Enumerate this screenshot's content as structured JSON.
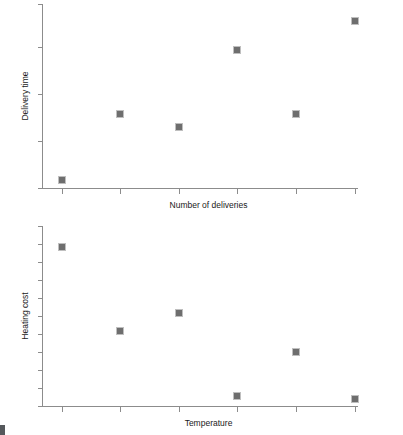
{
  "figure": {
    "background_color": "#ffffff",
    "marker_color": "#6e6e6e",
    "axis_color": "#8c8c8c",
    "text_color": "#1a1a1a",
    "panel_count": 2
  },
  "panels": {
    "top": {
      "name": "delivery-time-scatter",
      "xlabel": "Number of deliveries",
      "ylabel": "Delivery time"
    },
    "bottom": {
      "name": "heating-cost-scatter",
      "xlabel": "Temperature",
      "ylabel": "Heating cost"
    }
  },
  "chart_data": [
    {
      "type": "scatter",
      "title": "",
      "xlabel": "Number of deliveries",
      "ylabel": "Delivery time",
      "grid": false,
      "legend": null,
      "xlim": [
        0,
        6
      ],
      "ylim": [
        0,
        10
      ],
      "x_ticks": [
        1,
        2,
        3,
        4,
        5,
        6
      ],
      "x_tick_labels": [
        "",
        "",
        "",
        "",
        "",
        ""
      ],
      "y_ticks": [
        1,
        3,
        5,
        7,
        9
      ],
      "y_tick_labels": [
        "",
        "",
        "",
        "",
        ""
      ],
      "x": [
        1,
        2,
        3,
        4,
        5,
        6
      ],
      "y": [
        0.4,
        4.1,
        3.4,
        7.9,
        4.1,
        9.5
      ],
      "marker": "square",
      "marker_color": "#6e6e6e",
      "point_pixels": [
        {
          "x": 62,
          "y": 180
        },
        {
          "x": 120,
          "y": 114
        },
        {
          "x": 179,
          "y": 127
        },
        {
          "x": 237,
          "y": 50
        },
        {
          "x": 296,
          "y": 114
        },
        {
          "x": 355,
          "y": 21
        }
      ],
      "axis_pixels": {
        "x_axis_y": 188,
        "y_axis_x": 42,
        "x_axis_x0": 42,
        "x_axis_x1": 357,
        "y_axis_y0": 4,
        "y_axis_y1": 188,
        "x_tick_px": [
          62,
          120,
          179,
          237,
          296,
          355
        ],
        "y_tick_px": [
          4,
          47,
          94,
          141,
          188
        ]
      }
    },
    {
      "type": "scatter",
      "title": "",
      "xlabel": "Temperature",
      "ylabel": "Heating cost",
      "grid": false,
      "legend": null,
      "xlim": [
        0,
        6
      ],
      "ylim": [
        0,
        11
      ],
      "x_ticks": [
        1,
        2,
        3,
        4,
        5,
        6
      ],
      "x_tick_labels": [
        "",
        "",
        "",
        "",
        "",
        ""
      ],
      "y_ticks": [
        1,
        2,
        3,
        4,
        5,
        6,
        7,
        8,
        9,
        10,
        11
      ],
      "y_tick_labels": [
        "",
        "",
        "",
        "",
        "",
        "",
        "",
        "",
        "",
        "",
        ""
      ],
      "x": [
        1,
        2,
        3,
        4,
        5,
        6
      ],
      "y": [
        9.6,
        4.4,
        5.6,
        0.4,
        3.2,
        0.2
      ],
      "marker": "square",
      "marker_color": "#6e6e6e",
      "point_pixels": [
        {
          "x": 62,
          "y": 247
        },
        {
          "x": 120,
          "y": 331
        },
        {
          "x": 179,
          "y": 313
        },
        {
          "x": 237,
          "y": 396
        },
        {
          "x": 296,
          "y": 352
        },
        {
          "x": 355,
          "y": 399
        }
      ],
      "axis_pixels": {
        "x_axis_y": 406,
        "y_axis_x": 42,
        "x_axis_x0": 42,
        "x_axis_x1": 357,
        "y_axis_y0": 226,
        "y_axis_y1": 406,
        "x_tick_px": [
          62,
          120,
          179,
          237,
          296,
          355
        ],
        "y_tick_px": [
          226,
          244,
          262,
          280,
          298,
          316,
          334,
          352,
          370,
          388,
          406
        ]
      }
    }
  ]
}
